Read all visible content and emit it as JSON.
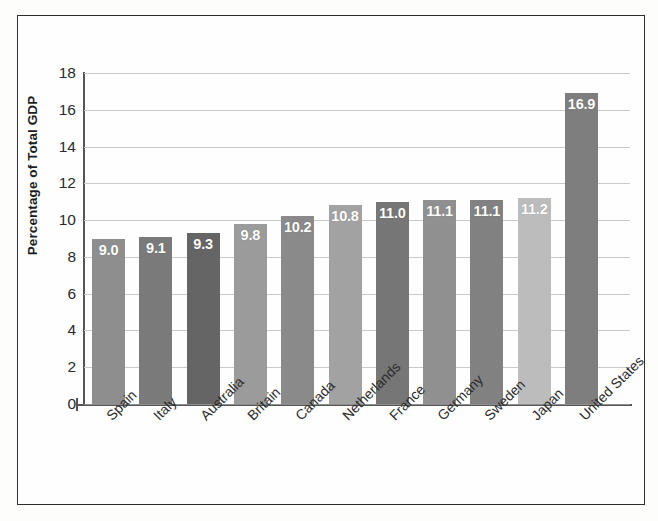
{
  "chart_data": {
    "type": "bar",
    "title": "",
    "subtitle": "",
    "xlabel": "",
    "ylabel": "Percentage of Total GDP",
    "categories": [
      "Spain",
      "Italy",
      "Australia",
      "Britain",
      "Canada",
      "Netherlands",
      "France",
      "Germany",
      "Sweden",
      "Japan",
      "United States"
    ],
    "values": [
      9.0,
      9.1,
      9.3,
      9.8,
      10.2,
      10.8,
      11.0,
      11.1,
      11.1,
      11.2,
      16.9
    ],
    "value_labels": [
      "9.0",
      "9.1",
      "9.3",
      "9.8",
      "10.2",
      "10.8",
      "11.0",
      "11.1",
      "11.1",
      "11.2",
      "16.9"
    ],
    "bar_colors": [
      "#8e8e8e",
      "#7a7a7a",
      "#656565",
      "#9b9b9b",
      "#8a8a8a",
      "#a2a2a2",
      "#767676",
      "#909090",
      "#818181",
      "#bcbcbc",
      "#7e7e7e"
    ],
    "ylim": [
      0,
      18
    ],
    "yticks": [
      0,
      2,
      4,
      6,
      8,
      10,
      12,
      14,
      16,
      18
    ],
    "ytick_labels": [
      "0",
      "2",
      "4",
      "6",
      "8",
      "10",
      "12",
      "14",
      "16",
      "18"
    ],
    "grid": true,
    "grid_color": "#c9c9c9",
    "legend": null,
    "legend_position": "none",
    "data_label_color": "#ffffff",
    "axis_color": "#555555",
    "background_color": "#fefefe",
    "frame_color": "#2e2e2e"
  }
}
